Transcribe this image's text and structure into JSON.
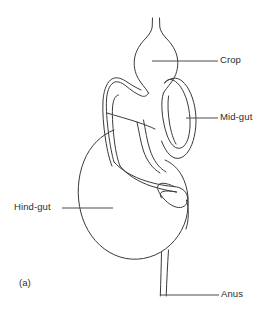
{
  "figure": {
    "caption": "(a)",
    "background_color": "#ffffff",
    "line_color": "#3a3a3a",
    "text_color": "#2c2c2c"
  },
  "labels": {
    "crop": "Crop",
    "mid_gut": "Mid-gut",
    "hind_gut": "Hind-gut",
    "anus": "Anus"
  },
  "leaders": {
    "crop": {
      "x1": 152,
      "y1": 61,
      "x2": 218,
      "y2": 61
    },
    "mid_gut": {
      "x1": 186,
      "y1": 118,
      "x2": 218,
      "y2": 118
    },
    "hind_gut": {
      "x1": 62,
      "y1": 208,
      "x2": 113,
      "y2": 208
    },
    "anus": {
      "x1": 160,
      "y1": 295,
      "x2": 219,
      "y2": 295
    }
  },
  "anatomy": {
    "parts": [
      {
        "name": "oesophagus",
        "description": "narrow parallel-sided tube entering from top"
      },
      {
        "name": "crop",
        "description": "bulbous teardrop-shaped sac below oesophagus"
      },
      {
        "name": "mid-gut",
        "description": "long looping tube forming left and right coils around the crop"
      },
      {
        "name": "hind-gut",
        "description": "large rounded sac on the lower left"
      },
      {
        "name": "rectum",
        "description": "narrow tube descending from hind-gut to anus"
      }
    ]
  }
}
